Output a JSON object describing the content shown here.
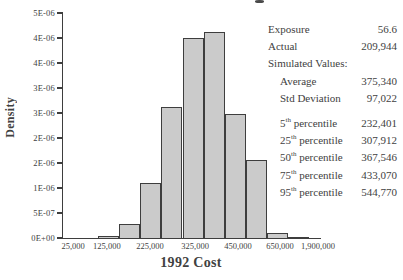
{
  "chart_data": {
    "type": "bar",
    "title": "",
    "xlabel": "1992 Cost",
    "ylabel": "Density",
    "ylim": [
      0,
      4.5e-06
    ],
    "grid": false,
    "legend": null,
    "y_ticks": [
      {
        "label": "0E+00",
        "value": 0
      },
      {
        "label": "5E-07",
        "value": 5e-07
      },
      {
        "label": "1E-06",
        "value": 1e-06
      },
      {
        "label": "2E-06",
        "value": 1.5e-06
      },
      {
        "label": "2E-06",
        "value": 2e-06
      },
      {
        "label": "3E-06",
        "value": 2.5e-06
      },
      {
        "label": "3E-06",
        "value": 3e-06
      },
      {
        "label": "4E-06",
        "value": 3.5e-06
      },
      {
        "label": "4E-06",
        "value": 4e-06
      },
      {
        "label": "5E-06",
        "value": 4.5e-06
      }
    ],
    "x_ticks": [
      {
        "label": "25,000",
        "pos_pct": 4.3
      },
      {
        "label": "125,000",
        "pos_pct": 17.4
      },
      {
        "label": "225,000",
        "pos_pct": 34.1
      },
      {
        "label": "325,000",
        "pos_pct": 51.6
      },
      {
        "label": "450,000",
        "pos_pct": 68.2
      },
      {
        "label": "650,000",
        "pos_pct": 84.5
      },
      {
        "label": "1,900,000",
        "pos_pct": 99.2
      }
    ],
    "bars": {
      "values_density": [
        4e-08,
        2.9e-07,
        1.11e-06,
        2.62e-06,
        4e-06,
        4.13e-06,
        2.48e-06,
        1.57e-06,
        1.1e-07,
        3e-08
      ],
      "first_left_pct": 13.6,
      "width_pct": 8.18
    },
    "colors": {
      "bar_fill": "#cbcbcb",
      "bar_border": "#3e3e3e",
      "axis": "#3e3e3e",
      "text": "#414141"
    }
  },
  "stats": {
    "rows": [
      {
        "label": "Exposure",
        "value": "56.6"
      },
      {
        "label": "Actual",
        "value": "209,944"
      },
      {
        "label": "Simulated Values:",
        "value": ""
      },
      {
        "label": "Average",
        "value": "375,340"
      },
      {
        "label": "Std Deviation",
        "value": "97,022"
      }
    ],
    "percentiles": [
      {
        "ord": "5",
        "sup": "th",
        "rest": " percentile",
        "value": "232,401"
      },
      {
        "ord": "25",
        "sup": "th",
        "rest": " percentile",
        "value": "307,912"
      },
      {
        "ord": "50",
        "sup": "th",
        "rest": " percentile",
        "value": "367,546"
      },
      {
        "ord": "75",
        "sup": "th",
        "rest": " percentile",
        "value": "433,070"
      },
      {
        "ord": "95",
        "sup": "th",
        "rest": " percentile",
        "value": "544,770"
      }
    ]
  }
}
